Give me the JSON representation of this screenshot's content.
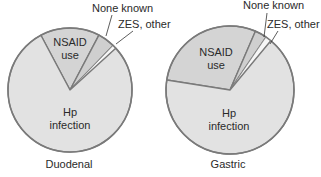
{
  "chart_data": [
    {
      "type": "pie",
      "title": "Duodenal",
      "center": [
        70,
        90
      ],
      "radius": 62,
      "start_angle_deg": -28,
      "slices": [
        {
          "name": "NSAID use",
          "value": 15.5,
          "fill": "#d4d4d4"
        },
        {
          "name": "None known",
          "value": 4.5,
          "fill": "#cfcfcf"
        },
        {
          "name": "ZES, other",
          "value": 1.0,
          "fill": "#f6f6f6"
        },
        {
          "name": "Hp infection",
          "value": 79.0,
          "fill": "#e2e2e2"
        }
      ],
      "labels": {
        "nsaid": {
          "line1": "NSAID",
          "line2": "use",
          "x": 70,
          "y": 46
        },
        "hp": {
          "line1": "Hp",
          "line2": "infection",
          "x": 70,
          "y": 115
        },
        "none_known": {
          "text": "None known",
          "x": 92,
          "y": 12
        },
        "zes": {
          "text": "ZES, other",
          "x": 118,
          "y": 28
        }
      }
    },
    {
      "type": "pie",
      "title": "Gastric",
      "center": [
        230,
        90
      ],
      "radius": 64,
      "start_angle_deg": -81,
      "slices": [
        {
          "name": "NSAID use",
          "value": 29.0,
          "fill": "#d4d4d4"
        },
        {
          "name": "None known",
          "value": 3.0,
          "fill": "#cfcfcf"
        },
        {
          "name": "ZES, other",
          "value": 1.5,
          "fill": "#f6f6f6"
        },
        {
          "name": "Hp infection",
          "value": 66.5,
          "fill": "#e2e2e2"
        }
      ],
      "labels": {
        "nsaid": {
          "line1": "NSAID",
          "line2": "use",
          "x": 216,
          "y": 56
        },
        "hp": {
          "line1": "Hp",
          "line2": "infection",
          "x": 229,
          "y": 116
        },
        "none_known": {
          "text": "None known",
          "x": 243,
          "y": 9
        },
        "zes": {
          "text": "ZES, other",
          "x": 265,
          "y": 28
        }
      }
    }
  ],
  "captions": [
    "Duodenal",
    "Gastric"
  ],
  "colors": {
    "outline": "#7a7a7a",
    "text": "#2a2a2a",
    "leader": "#333333"
  }
}
